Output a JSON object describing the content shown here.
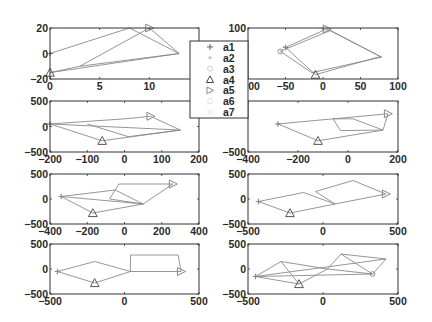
{
  "chart_data": [
    {
      "type": "line",
      "panel": "row1-left",
      "frame": {
        "x0": 50,
        "x1": 199,
        "y0": 28,
        "y1": 79
      },
      "xlim": [
        0,
        15
      ],
      "ylim": [
        -20,
        20
      ],
      "xticks": [
        0,
        5,
        10
      ],
      "yticks": [
        -20,
        0,
        20
      ],
      "xtick_labels": [
        "0",
        "5",
        "10"
      ],
      "ytick_labels": [
        "-20",
        "0",
        "20"
      ],
      "segments": [
        [
          [
            0,
            0
          ],
          [
            8,
            20
          ]
        ],
        [
          [
            8,
            20
          ],
          [
            13,
            0
          ]
        ],
        [
          [
            0,
            -15
          ],
          [
            13,
            0
          ]
        ],
        [
          [
            0,
            -15
          ],
          [
            3,
            -10
          ]
        ],
        [
          [
            3,
            -10
          ],
          [
            10,
            20
          ]
        ],
        [
          [
            10,
            20
          ],
          [
            13,
            0
          ]
        ],
        [
          [
            3,
            -10
          ],
          [
            13,
            0
          ]
        ]
      ],
      "markers": [
        {
          "series": "a1",
          "shape": "plus",
          "x": 0,
          "y": 0
        },
        {
          "series": "a4",
          "shape": "triangle-up",
          "x": 0,
          "y": -15
        },
        {
          "series": "a5",
          "shape": "triangle-right",
          "x": 10,
          "y": 20
        }
      ]
    },
    {
      "type": "line",
      "panel": "row1-right",
      "frame": {
        "x0": 248,
        "x1": 398,
        "y0": 28,
        "y1": 79
      },
      "xlim": [
        -100,
        100
      ],
      "ylim": [
        -5,
        100
      ],
      "xticks": [
        -100,
        -50,
        0,
        50,
        100
      ],
      "yticks": [
        100
      ],
      "xtick_labels": [
        "-100",
        "-50",
        "0",
        "50",
        "100"
      ],
      "ytick_labels": [
        "100"
      ],
      "segments": [
        [
          [
            -50,
            60
          ],
          [
            5,
            98
          ]
        ],
        [
          [
            5,
            98
          ],
          [
            78,
            40
          ]
        ],
        [
          [
            -57,
            52
          ],
          [
            10,
            95
          ]
        ],
        [
          [
            10,
            95
          ],
          [
            78,
            40
          ]
        ],
        [
          [
            -57,
            52
          ],
          [
            -15,
            8
          ]
        ],
        [
          [
            -15,
            8
          ],
          [
            78,
            40
          ]
        ],
        [
          [
            -50,
            60
          ],
          [
            -10,
            4
          ]
        ],
        [
          [
            -10,
            4
          ],
          [
            78,
            42
          ]
        ]
      ],
      "markers": [
        {
          "series": "a1",
          "shape": "plus",
          "x": -50,
          "y": 60
        },
        {
          "series": "a4",
          "shape": "triangle-up",
          "x": -10,
          "y": 4
        },
        {
          "series": "a5",
          "shape": "triangle-right",
          "x": 5,
          "y": 98
        },
        {
          "series": "a3",
          "shape": "circle",
          "x": -57,
          "y": 52
        }
      ]
    },
    {
      "type": "line",
      "panel": "row2-left",
      "frame": {
        "x0": 50,
        "x1": 199,
        "y0": 101,
        "y1": 152
      },
      "xlim": [
        -200,
        200
      ],
      "ylim": [
        -500,
        500
      ],
      "xticks": [
        -200,
        -100,
        0,
        100,
        200
      ],
      "yticks": [
        -500,
        0,
        500
      ],
      "xtick_labels": [
        "-200",
        "-100",
        "0",
        "100",
        "200"
      ],
      "ytick_labels": [
        "-500",
        "0",
        "500"
      ],
      "segments": [
        [
          [
            -200,
            50
          ],
          [
            0,
            150
          ]
        ],
        [
          [
            0,
            150
          ],
          [
            70,
            200
          ]
        ],
        [
          [
            70,
            200
          ],
          [
            150,
            -70
          ]
        ],
        [
          [
            -200,
            50
          ],
          [
            150,
            -70
          ]
        ],
        [
          [
            -200,
            50
          ],
          [
            -60,
            -280
          ]
        ],
        [
          [
            -60,
            -280
          ],
          [
            150,
            -70
          ]
        ],
        [
          [
            -100,
            50
          ],
          [
            10,
            -200
          ]
        ],
        [
          [
            10,
            -200
          ],
          [
            150,
            -70
          ]
        ]
      ],
      "markers": [
        {
          "series": "a1",
          "shape": "plus",
          "x": -200,
          "y": 50
        },
        {
          "series": "a4",
          "shape": "triangle-up",
          "x": -60,
          "y": -280
        },
        {
          "series": "a5",
          "shape": "triangle-right",
          "x": 70,
          "y": 200
        }
      ]
    },
    {
      "type": "line",
      "panel": "row2-right",
      "frame": {
        "x0": 248,
        "x1": 398,
        "y0": 101,
        "y1": 152
      },
      "xlim": [
        -400,
        200
      ],
      "ylim": [
        -500,
        500
      ],
      "xticks": [
        -400,
        -200,
        0,
        200
      ],
      "yticks": [
        -500
      ],
      "xtick_labels": [
        "-400",
        "-200",
        "0",
        "200"
      ],
      "ytick_labels": [
        "-500"
      ],
      "segments": [
        [
          [
            -280,
            50
          ],
          [
            160,
            250
          ]
        ],
        [
          [
            -280,
            50
          ],
          [
            -120,
            -280
          ]
        ],
        [
          [
            -120,
            -280
          ],
          [
            140,
            -70
          ]
        ],
        [
          [
            160,
            250
          ],
          [
            140,
            -70
          ]
        ],
        [
          [
            -60,
            150
          ],
          [
            20,
            150
          ]
        ],
        [
          [
            20,
            150
          ],
          [
            140,
            -70
          ]
        ],
        [
          [
            -60,
            150
          ],
          [
            -30,
            -80
          ]
        ],
        [
          [
            -30,
            -80
          ],
          [
            140,
            -70
          ]
        ]
      ],
      "markers": [
        {
          "series": "a1",
          "shape": "plus",
          "x": -280,
          "y": 50
        },
        {
          "series": "a4",
          "shape": "triangle-up",
          "x": -120,
          "y": -280
        },
        {
          "series": "a5",
          "shape": "triangle-right",
          "x": 160,
          "y": 250
        }
      ]
    },
    {
      "type": "line",
      "panel": "row3-left",
      "frame": {
        "x0": 50,
        "x1": 199,
        "y0": 174,
        "y1": 224
      },
      "xlim": [
        -400,
        400
      ],
      "ylim": [
        -500,
        500
      ],
      "xticks": [
        -400,
        -200,
        0,
        200,
        400
      ],
      "yticks": [
        -500,
        0,
        500
      ],
      "xtick_labels": [
        "-400",
        "-200",
        "0",
        "200",
        "400"
      ],
      "ytick_labels": [
        "-500",
        "0",
        "500"
      ],
      "segments": [
        [
          [
            -340,
            50
          ],
          [
            -50,
            180
          ]
        ],
        [
          [
            -50,
            180
          ],
          [
            100,
            -100
          ]
        ],
        [
          [
            -340,
            50
          ],
          [
            100,
            -100
          ]
        ],
        [
          [
            -340,
            50
          ],
          [
            -170,
            -280
          ]
        ],
        [
          [
            -170,
            -280
          ],
          [
            100,
            -100
          ]
        ],
        [
          [
            -30,
            300
          ],
          [
            260,
            300
          ]
        ],
        [
          [
            -30,
            300
          ],
          [
            -80,
            0
          ]
        ],
        [
          [
            -80,
            0
          ],
          [
            100,
            -100
          ]
        ],
        [
          [
            260,
            300
          ],
          [
            100,
            -100
          ]
        ]
      ],
      "markers": [
        {
          "series": "a1",
          "shape": "plus",
          "x": -340,
          "y": 50
        },
        {
          "series": "a4",
          "shape": "triangle-up",
          "x": -170,
          "y": -280
        },
        {
          "series": "a5",
          "shape": "triangle-right",
          "x": 260,
          "y": 300
        }
      ]
    },
    {
      "type": "line",
      "panel": "row3-right",
      "frame": {
        "x0": 248,
        "x1": 398,
        "y0": 174,
        "y1": 224
      },
      "xlim": [
        -500,
        500
      ],
      "ylim": [
        -500,
        500
      ],
      "xticks": [
        -500,
        0,
        500
      ],
      "yticks": [
        -500,
        0,
        500
      ],
      "xtick_labels": [
        "-500",
        "0",
        "500"
      ],
      "ytick_labels": [
        "-500",
        "0",
        "500"
      ],
      "segments": [
        [
          [
            -430,
            -50
          ],
          [
            -130,
            130
          ]
        ],
        [
          [
            -130,
            130
          ],
          [
            80,
            -100
          ]
        ],
        [
          [
            -430,
            -50
          ],
          [
            -220,
            -280
          ]
        ],
        [
          [
            -220,
            -280
          ],
          [
            80,
            -100
          ]
        ],
        [
          [
            -50,
            150
          ],
          [
            200,
            370
          ]
        ],
        [
          [
            200,
            370
          ],
          [
            420,
            100
          ]
        ],
        [
          [
            -50,
            150
          ],
          [
            80,
            -100
          ]
        ],
        [
          [
            80,
            -100
          ],
          [
            420,
            100
          ]
        ]
      ],
      "markers": [
        {
          "series": "a1",
          "shape": "plus",
          "x": -430,
          "y": -50
        },
        {
          "series": "a4",
          "shape": "triangle-up",
          "x": -220,
          "y": -280
        },
        {
          "series": "a5",
          "shape": "triangle-right",
          "x": 420,
          "y": 100
        }
      ]
    },
    {
      "type": "line",
      "panel": "row4-left",
      "frame": {
        "x0": 50,
        "x1": 199,
        "y0": 244,
        "y1": 294
      },
      "xlim": [
        -500,
        500
      ],
      "ylim": [
        -500,
        500
      ],
      "xticks": [
        -500,
        0,
        500
      ],
      "yticks": [
        -500,
        0,
        500
      ],
      "xtick_labels": [
        "-500",
        "0",
        "500"
      ],
      "ytick_labels": [
        "-500",
        "0",
        "500"
      ],
      "segments": [
        [
          [
            -450,
            -50
          ],
          [
            -200,
            150
          ]
        ],
        [
          [
            -200,
            150
          ],
          [
            40,
            -50
          ]
        ],
        [
          [
            -450,
            -50
          ],
          [
            -200,
            -280
          ]
        ],
        [
          [
            -200,
            -280
          ],
          [
            40,
            -50
          ]
        ],
        [
          [
            40,
            -50
          ],
          [
            40,
            280
          ]
        ],
        [
          [
            40,
            280
          ],
          [
            360,
            280
          ]
        ],
        [
          [
            360,
            280
          ],
          [
            380,
            -50
          ]
        ],
        [
          [
            40,
            -50
          ],
          [
            380,
            -50
          ]
        ]
      ],
      "markers": [
        {
          "series": "a1",
          "shape": "plus",
          "x": -450,
          "y": -50
        },
        {
          "series": "a4",
          "shape": "triangle-up",
          "x": -200,
          "y": -280
        },
        {
          "series": "a5",
          "shape": "triangle-right",
          "x": 380,
          "y": -50
        }
      ]
    },
    {
      "type": "line",
      "panel": "row4-right",
      "frame": {
        "x0": 248,
        "x1": 398,
        "y0": 244,
        "y1": 294
      },
      "xlim": [
        -500,
        500
      ],
      "ylim": [
        -500,
        500
      ],
      "xticks": [
        -500,
        0,
        500
      ],
      "yticks": [
        -500,
        0,
        500
      ],
      "xtick_labels": [
        "-500",
        "0",
        "500"
      ],
      "ytick_labels": [
        "-500",
        "0",
        "500"
      ],
      "segments": [
        [
          [
            -450,
            -150
          ],
          [
            -280,
            150
          ]
        ],
        [
          [
            -280,
            150
          ],
          [
            -160,
            -300
          ]
        ],
        [
          [
            -450,
            -150
          ],
          [
            -160,
            -300
          ]
        ],
        [
          [
            -280,
            150
          ],
          [
            30,
            0
          ]
        ],
        [
          [
            -450,
            -150
          ],
          [
            420,
            200
          ]
        ],
        [
          [
            -160,
            -300
          ],
          [
            30,
            0
          ]
        ],
        [
          [
            30,
            0
          ],
          [
            120,
            300
          ]
        ],
        [
          [
            120,
            300
          ],
          [
            420,
            200
          ]
        ],
        [
          [
            120,
            300
          ],
          [
            330,
            -100
          ]
        ],
        [
          [
            30,
            0
          ],
          [
            330,
            -100
          ]
        ],
        [
          [
            -450,
            -150
          ],
          [
            330,
            -100
          ]
        ],
        [
          [
            330,
            -100
          ],
          [
            420,
            200
          ]
        ]
      ],
      "markers": [
        {
          "series": "a1",
          "shape": "plus",
          "x": -450,
          "y": -150
        },
        {
          "series": "a4",
          "shape": "triangle-up",
          "x": -160,
          "y": -300
        },
        {
          "series": "a6",
          "shape": "circle",
          "x": 330,
          "y": -100
        }
      ]
    }
  ],
  "legend": {
    "box": {
      "x": 190,
      "y": 41,
      "w": 58,
      "h": 77
    },
    "entries": [
      {
        "label": "a1",
        "shape": "plus",
        "color": "#777777"
      },
      {
        "label": "a2",
        "shape": "dot",
        "color": "#aaaaaa"
      },
      {
        "label": "a3",
        "shape": "circle",
        "color": "#cccccc"
      },
      {
        "label": "a4",
        "shape": "triangle-up",
        "color": "#444444"
      },
      {
        "label": "a5",
        "shape": "triangle-right",
        "color": "#888888"
      },
      {
        "label": "a6",
        "shape": "circle",
        "color": "#dddddd"
      },
      {
        "label": "a7",
        "shape": "x",
        "color": "#dddddd"
      }
    ]
  },
  "colors": {
    "frame": "#333333",
    "series_line": "#8a8a8a",
    "text": "#2a2a2a",
    "background": "#ffffff"
  }
}
